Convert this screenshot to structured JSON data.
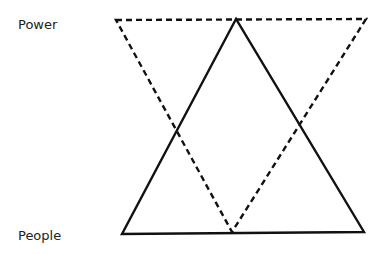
{
  "labels": {
    "top": "Power",
    "bottom": "People"
  },
  "shapes": {
    "dashed_triangle": {
      "style": "dashed",
      "color": "#111111",
      "points": "116,20 366,19 232,232"
    },
    "solid_triangle": {
      "style": "solid",
      "color": "#111111",
      "points": "236,19 122,234 364,232"
    }
  }
}
